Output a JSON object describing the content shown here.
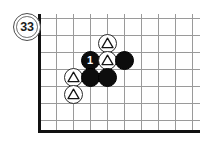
{
  "diagram": {
    "move_label": "33",
    "board": {
      "edge_color": "#111111",
      "line_color": "#9a9a9a",
      "background": "#ffffff",
      "grid_spacing": 17,
      "vertical_lines_x": [
        39,
        56,
        73,
        90,
        107,
        124,
        141,
        158,
        175,
        192
      ],
      "horizontal_lines_y": [
        18,
        35,
        52,
        69,
        86,
        103,
        120
      ],
      "left_edge_x": 39,
      "bottom_edge_y": 131,
      "left_edge_top_y": 14,
      "bottom_edge_right_x": 200
    },
    "stones": [
      {
        "id": "w-a",
        "color": "white",
        "marker": "triangle",
        "label": "",
        "x": 107,
        "y": 43
      },
      {
        "id": "b-1",
        "color": "black",
        "marker": "number",
        "label": "1",
        "x": 90,
        "y": 60
      },
      {
        "id": "w-b",
        "color": "white",
        "marker": "triangle",
        "label": "",
        "x": 107,
        "y": 60
      },
      {
        "id": "b-c",
        "color": "black",
        "marker": "none",
        "label": "",
        "x": 124,
        "y": 60
      },
      {
        "id": "w-c",
        "color": "white",
        "marker": "triangle",
        "label": "",
        "x": 73,
        "y": 77
      },
      {
        "id": "b-d",
        "color": "black",
        "marker": "none",
        "label": "",
        "x": 90,
        "y": 77
      },
      {
        "id": "b-e",
        "color": "black",
        "marker": "none",
        "label": "",
        "x": 107,
        "y": 77
      },
      {
        "id": "w-d",
        "color": "white",
        "marker": "triangle",
        "label": "",
        "x": 73,
        "y": 94
      }
    ],
    "label_position": {
      "x": 13,
      "y": 13
    },
    "colors": {
      "black_stone": "#0d0d0d",
      "white_stone": "#ffffff",
      "stone_outline": "#2b2b2b",
      "grid": "#9a9a9a",
      "board_edge": "#111111",
      "number_text": "#ffffff"
    }
  }
}
